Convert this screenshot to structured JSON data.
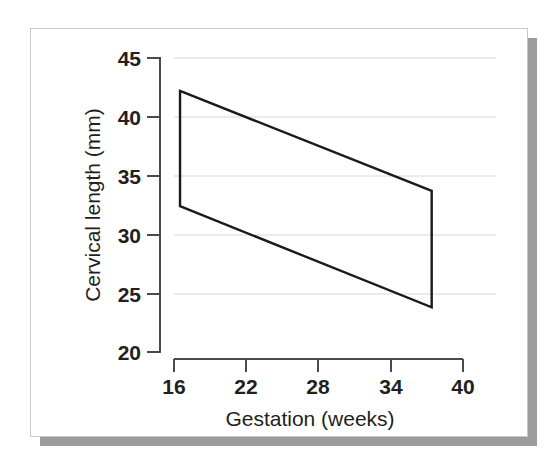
{
  "figure": {
    "frame": {
      "border_color": "#c9c9c9",
      "shadow_color": "#9c9c9c",
      "background_color": "#ffffff"
    }
  },
  "chart_data": {
    "type": "line",
    "title": "",
    "subtitle": "",
    "xlabel": "Gestation (weeks)",
    "ylabel": "Cervical length (mm)",
    "xlim": [
      16,
      40
    ],
    "ylim": [
      20,
      45
    ],
    "xticks": [
      16,
      22,
      28,
      34,
      40
    ],
    "yticks": [
      20,
      25,
      30,
      35,
      40,
      45
    ],
    "xticklabels": [
      "16",
      "22",
      "28",
      "34",
      "40"
    ],
    "yticklabels": [
      "20",
      "25",
      "30",
      "35",
      "40",
      "45"
    ],
    "grid": "horizontal",
    "grid_color": "#d7d7d7",
    "legend": "none",
    "series": [
      {
        "name": "Upper bound (reference band)",
        "x": [
          16.5,
          37.4
        ],
        "values": [
          42.2,
          33.7
        ],
        "color": "#1a1a1a"
      },
      {
        "name": "Lower bound (reference band)",
        "x": [
          16.5,
          37.4
        ],
        "values": [
          32.4,
          23.8
        ],
        "color": "#1a1a1a"
      }
    ],
    "band_vertices": [
      {
        "label": "upper-left",
        "x": 16.5,
        "y": 42.2
      },
      {
        "label": "upper-right",
        "x": 37.4,
        "y": 33.7
      },
      {
        "label": "lower-right",
        "x": 37.4,
        "y": 23.8
      },
      {
        "label": "lower-left",
        "x": 16.5,
        "y": 32.4
      }
    ],
    "annotations": []
  }
}
